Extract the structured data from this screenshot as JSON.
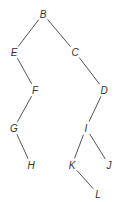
{
  "diagram": {
    "type": "binary-tree",
    "nodes": [
      {
        "id": "B",
        "label": "B",
        "x": 43,
        "y": 14
      },
      {
        "id": "E",
        "label": "E",
        "x": 14,
        "y": 52
      },
      {
        "id": "C",
        "label": "C",
        "x": 75,
        "y": 52
      },
      {
        "id": "F",
        "label": "F",
        "x": 35,
        "y": 90
      },
      {
        "id": "D",
        "label": "D",
        "x": 104,
        "y": 90
      },
      {
        "id": "G",
        "label": "G",
        "x": 14,
        "y": 128
      },
      {
        "id": "I",
        "label": "I",
        "x": 86,
        "y": 128
      },
      {
        "id": "H",
        "label": "H",
        "x": 31,
        "y": 165
      },
      {
        "id": "K",
        "label": "K",
        "x": 72,
        "y": 165
      },
      {
        "id": "J",
        "label": "J",
        "x": 109,
        "y": 165
      },
      {
        "id": "L",
        "label": "L",
        "x": 98,
        "y": 194
      }
    ],
    "edges": [
      [
        "B",
        "E"
      ],
      [
        "B",
        "C"
      ],
      [
        "E",
        "F"
      ],
      [
        "C",
        "D"
      ],
      [
        "F",
        "G"
      ],
      [
        "D",
        "I"
      ],
      [
        "G",
        "H"
      ],
      [
        "I",
        "K"
      ],
      [
        "I",
        "J"
      ],
      [
        "K",
        "L"
      ]
    ]
  }
}
